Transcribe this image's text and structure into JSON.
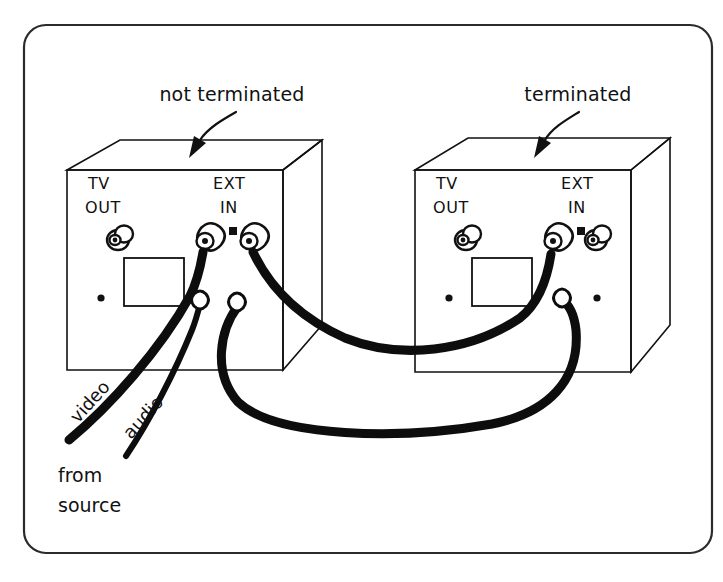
{
  "figure": {
    "background_color": "#ffffff",
    "ink_color": "#111111",
    "frame": {
      "name": "rounded-frame",
      "x": 24,
      "y": 25,
      "width": 688,
      "height": 528,
      "radius": 22
    }
  },
  "callouts": [
    {
      "id": "left",
      "label": "not terminated",
      "text_x": 232,
      "text_y": 101,
      "points_to": "left-tv"
    },
    {
      "id": "right",
      "label": "terminated",
      "text_x": 568,
      "text_y": 101,
      "points_to": "right-tv"
    }
  ],
  "devices": [
    {
      "id": "left-tv",
      "name": "left-tv-unit",
      "state": "not terminated",
      "ports": [
        {
          "id": "tv-out",
          "label_line1": "TV",
          "label_line2": "OUT",
          "type": "coax-jack",
          "connected": false
        },
        {
          "id": "ext-in",
          "label_line1": "EXT",
          "label_line2": "IN",
          "type": "coax-jack",
          "connected": true
        }
      ],
      "extra_jack_connected": true
    },
    {
      "id": "right-tv",
      "name": "right-tv-unit",
      "state": "terminated",
      "ports": [
        {
          "id": "tv-out",
          "label_line1": "TV",
          "label_line2": "OUT",
          "type": "coax-jack",
          "connected": false
        },
        {
          "id": "ext-in",
          "label_line1": "EXT",
          "label_line2": "IN",
          "type": "coax-jack",
          "connected": true
        }
      ],
      "extra_jack_connected": false
    }
  ],
  "port_labels": {
    "left": {
      "tv": "TV",
      "out": "OUT",
      "ext": "EXT",
      "in": "IN"
    },
    "right": {
      "tv": "TV",
      "out": "OUT",
      "ext": "EXT",
      "in": "IN"
    }
  },
  "cables": [
    {
      "id": "video",
      "label": "video",
      "rotation_deg": -48,
      "label_x": 78,
      "label_y": 424,
      "from": "source",
      "to": "left-tv ext-in upper jack"
    },
    {
      "id": "audio",
      "label": "audio",
      "rotation_deg": -48,
      "label_x": 131,
      "label_y": 436,
      "from": "source",
      "to": "left-tv lower jack"
    },
    {
      "id": "loop-upper",
      "label": "",
      "from": "left-tv ext-in right jack",
      "to": "right-tv upper jack"
    },
    {
      "id": "loop-lower",
      "label": "",
      "from": "left-tv lower jack",
      "to": "right-tv lower jack"
    }
  ],
  "source_note": {
    "name": "from-source-note",
    "line1": "from",
    "line2": "source",
    "x": 58,
    "y_line1": 482,
    "y_line2": 512
  }
}
